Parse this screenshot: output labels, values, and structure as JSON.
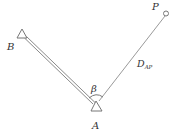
{
  "diagram": {
    "type": "surveying-polar-setout",
    "points": {
      "A": {
        "label": "A",
        "symbol": "triangle-station"
      },
      "B": {
        "label": "B",
        "symbol": "triangle-station"
      },
      "P": {
        "label": "P",
        "symbol": "circle-point"
      }
    },
    "angle_label": "β",
    "distance_label_main": "D",
    "distance_label_sub": "AP",
    "edges": [
      {
        "from": "B",
        "to": "A",
        "style": "double-line"
      },
      {
        "from": "A",
        "to": "P",
        "style": "single-line",
        "label": "D_AP"
      }
    ],
    "colors": {
      "line": "#8a8a8a",
      "text": "#333333"
    }
  }
}
